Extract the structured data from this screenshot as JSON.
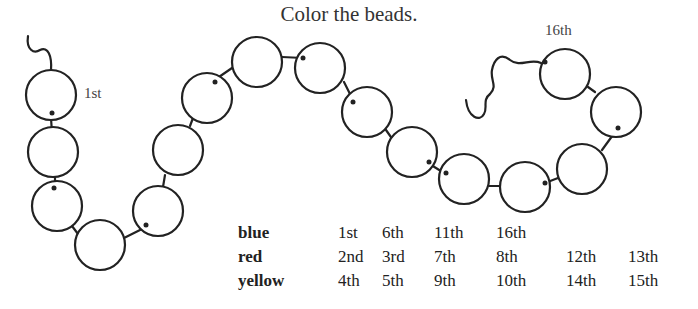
{
  "title": "Color the beads.",
  "labels": {
    "first": "1st",
    "last": "16th"
  },
  "bead_count": 16,
  "table": {
    "rows": [
      {
        "color": "blue",
        "positions": [
          "1st",
          "6th",
          "11th",
          "16th"
        ]
      },
      {
        "color": "red",
        "positions": [
          "2nd",
          "3rd",
          "7th",
          "8th",
          "12th",
          "13th"
        ]
      },
      {
        "color": "yellow",
        "positions": [
          "4th",
          "5th",
          "9th",
          "10th",
          "14th",
          "15th"
        ]
      }
    ]
  }
}
